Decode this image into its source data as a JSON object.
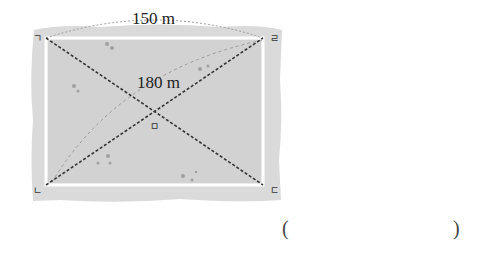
{
  "diagram": {
    "top_length_label": "150 m",
    "diagonal_length_label": "180 m",
    "corner_labels": {
      "top_left": "ㄱ",
      "top_right": "ㄹ",
      "bottom_left": "ㄴ",
      "bottom_right": "ㄷ"
    },
    "center_label": "ㅁ",
    "colors": {
      "field": "#d9d9d9",
      "field_border": "#ffffff",
      "diagonal": "#333333",
      "arc": "#9a9a9a"
    }
  },
  "answer": {
    "open_paren": "(",
    "close_paren": ")",
    "value": ""
  }
}
